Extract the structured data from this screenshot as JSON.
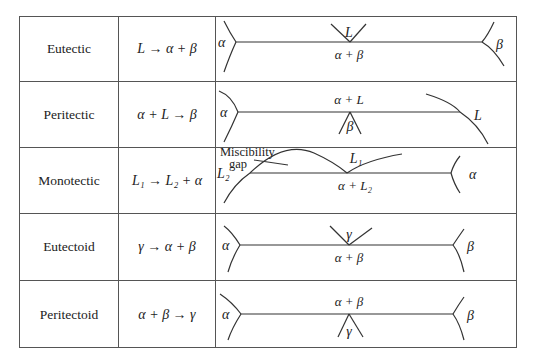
{
  "table": {
    "rows": [
      {
        "name": "Eutectic",
        "reaction": "L → α + β",
        "diagram": {
          "type": "eutectic",
          "left_phase": "α",
          "right_phase": "β",
          "top_phase": "L",
          "middle_label": "α + β"
        }
      },
      {
        "name": "Peritectic",
        "reaction": "α + L → β",
        "diagram": {
          "type": "peritectic",
          "left_phase": "α",
          "right_phase": "L",
          "bottom_phase": "β",
          "middle_label": "α + L"
        }
      },
      {
        "name": "Monotectic",
        "reaction": "L₁ → L₂ + α",
        "diagram": {
          "type": "monotectic",
          "left_phase": "L₂",
          "right_phase": "α",
          "top_phase": "L₁",
          "middle_label": "α + L₂",
          "annotation_line1": "Miscibility",
          "annotation_line2": "gap"
        }
      },
      {
        "name": "Eutectoid",
        "reaction": "γ → α + β",
        "diagram": {
          "type": "eutectoid",
          "left_phase": "α",
          "right_phase": "β",
          "top_phase": "γ",
          "middle_label": "α + β"
        }
      },
      {
        "name": "Peritectoid",
        "reaction": "α + β → γ",
        "diagram": {
          "type": "peritectoid",
          "left_phase": "α",
          "right_phase": "β",
          "bottom_phase": "γ",
          "middle_label": "α + β"
        }
      }
    ]
  }
}
